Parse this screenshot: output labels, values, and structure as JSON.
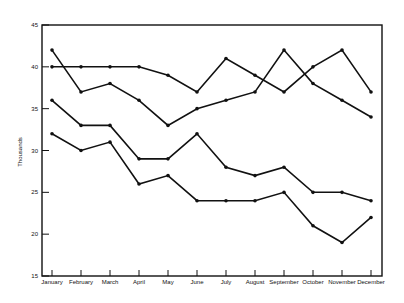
{
  "chart_data": {
    "type": "line",
    "title": "",
    "xlabel": "",
    "ylabel": "Thousands",
    "ylim": [
      15,
      45
    ],
    "yticks": [
      "15",
      "20",
      "25",
      "30",
      "35",
      "40",
      "45"
    ],
    "categories": [
      "January",
      "February",
      "March",
      "April",
      "May",
      "June",
      "July",
      "August",
      "September",
      "October",
      "November",
      "December"
    ],
    "grid": false,
    "legend": "none",
    "series": [
      {
        "name": "Series 1",
        "values": [
          40,
          40,
          40,
          40,
          39,
          37,
          41,
          39,
          37,
          40,
          42,
          37
        ],
        "color": "#111111"
      },
      {
        "name": "Series 2",
        "values": [
          42,
          37,
          38,
          36,
          33,
          35,
          36,
          37,
          42,
          38,
          36,
          34
        ],
        "color": "#111111"
      },
      {
        "name": "Series 3",
        "values": [
          36,
          33,
          33,
          29,
          29,
          32,
          28,
          27,
          28,
          25,
          25,
          24
        ],
        "color": "#111111"
      },
      {
        "name": "Series 4",
        "values": [
          32,
          30,
          31,
          26,
          27,
          24,
          24,
          24,
          25,
          21,
          19,
          22
        ],
        "color": "#111111"
      }
    ]
  }
}
